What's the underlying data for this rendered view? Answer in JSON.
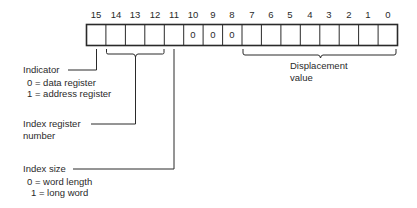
{
  "diagram": {
    "type": "bit-field-layout",
    "register_width_bits": 16,
    "bit_numbers": [
      "15",
      "14",
      "13",
      "12",
      "11",
      "10",
      "9",
      "8",
      "7",
      "6",
      "5",
      "4",
      "3",
      "2",
      "1",
      "0"
    ],
    "cell_values": [
      "",
      "",
      "",
      "",
      "",
      "0",
      "0",
      "0",
      "",
      "",
      "",
      "",
      "",
      "",
      "",
      ""
    ],
    "fields": {
      "indicator": {
        "bits": "15",
        "title": "Indicator",
        "line1": "0 = data register",
        "line2": "1 = address register"
      },
      "index_register": {
        "bits": "14-12",
        "title_line1": "Index register",
        "title_line2": "number"
      },
      "index_size": {
        "bits": "11",
        "title": "Index size",
        "line1": "0 = word length",
        "line2": "1 = long word"
      },
      "displacement": {
        "bits": "7-0",
        "title_line1": "Displacement",
        "title_line2": "value"
      }
    },
    "colors": {
      "ink": "#2a2a2a",
      "background": "#ffffff"
    }
  }
}
